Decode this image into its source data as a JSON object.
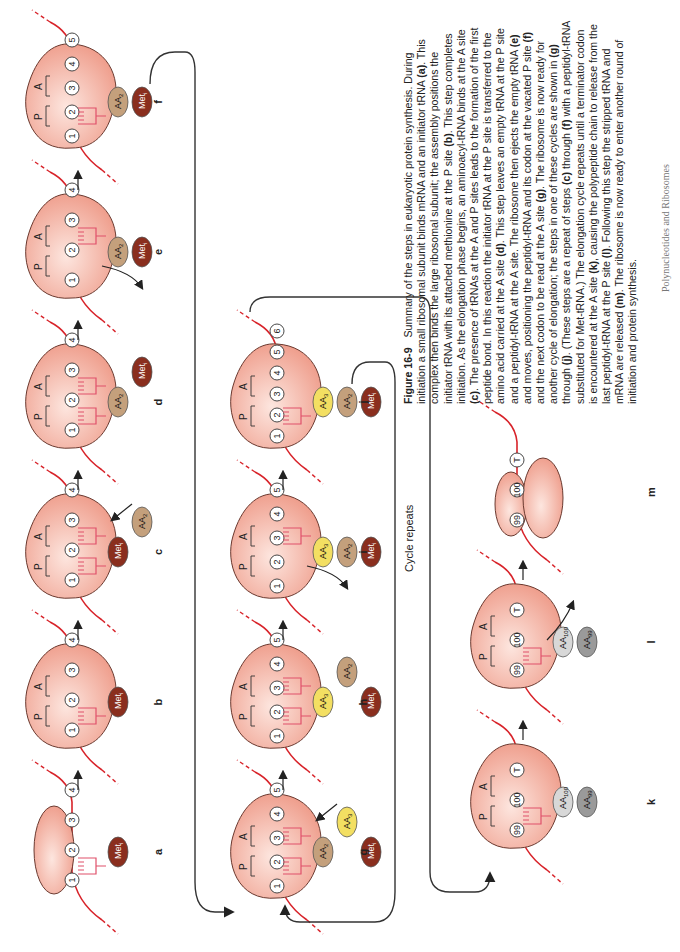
{
  "figure": {
    "number": "Figure 16-9",
    "caption_segments": [
      {
        "text": "Summary of the steps in eukaryotic protein synthesis. During initiation a small ribosomal subunit binds mRNA and an initiator tRNA "
      },
      {
        "text": "(a)",
        "bold": true
      },
      {
        "text": ". This complex then binds the large ribosomal subunit; the assembly positions the initiator tRNA with its attached methionine at the P site "
      },
      {
        "text": "(b)",
        "bold": true
      },
      {
        "text": ". This step completes initiation. As the elongation phase begins, an aminoacyl-tRNA binds at the A site "
      },
      {
        "text": "(c)",
        "bold": true
      },
      {
        "text": ". The presence of tRNAs at the A and P sites leads to the formation of the first peptide bond. In this reaction the initiator tRNA at the P site is transferred to the amino acid carried at the A site "
      },
      {
        "text": "(d)",
        "bold": true
      },
      {
        "text": ". This step leaves an empty tRNA at the P site and a peptidyl-tRNA at the A site. The ribosome then ejects the empty tRNA "
      },
      {
        "text": "(e)",
        "bold": true
      },
      {
        "text": " and moves, positioning the peptidyl-tRNA and its codon at the vacated P site "
      },
      {
        "text": "(f)",
        "bold": true
      },
      {
        "text": " and the next codon to be read at the A site "
      },
      {
        "text": "(g)",
        "bold": true
      },
      {
        "text": ". The ribosome is now ready for another cycle of elongation; the steps in one of these cycles are shown in "
      },
      {
        "text": "(g)",
        "bold": true
      },
      {
        "text": " through "
      },
      {
        "text": "(j)",
        "bold": true
      },
      {
        "text": ". (These steps are a repeat of steps "
      },
      {
        "text": "(c)",
        "bold": true
      },
      {
        "text": " through "
      },
      {
        "text": "(f)",
        "bold": true
      },
      {
        "text": " with a peptidyl-tRNA substituted for Met-tRNA.) The elongation cycle repeats until a terminator codon is encountered at the A site "
      },
      {
        "text": "(k)",
        "bold": true
      },
      {
        "text": ", causing the polypeptide chain to release from the last peptidyl-tRNA at the P site "
      },
      {
        "text": "(l)",
        "bold": true
      },
      {
        "text": ". Following this step the stripped tRNA and mRNA are released "
      },
      {
        "text": "(m)",
        "bold": true
      },
      {
        "text": ". The ribosome is now ready to enter another round of initiation and protein synthesis."
      }
    ]
  },
  "cycle_label": "Cycle repeats",
  "footer": "Polynucleotides and Ribosomes",
  "colors": {
    "ribosome": "#f0a596",
    "ribosome_light": "#fbe1da",
    "mrna": "#d8232a",
    "trna": "#e0506a",
    "met": "#8a2e1e",
    "aa2": "#c4a07c",
    "aa3": "#f3df62",
    "aa100": "#d8d8d8",
    "aa99": "#9a9a9a"
  },
  "site_labels": {
    "p": "P",
    "a": "A"
  },
  "panels": [
    {
      "id": "a",
      "label": "a",
      "x": 40,
      "y": 10,
      "subunit": "small",
      "codons": [
        "1",
        "2",
        "3",
        "4"
      ],
      "chain": [
        "Met_i"
      ],
      "trna_sites": [
        "P"
      ],
      "sites": false
    },
    {
      "id": "b",
      "label": "b",
      "x": 190,
      "y": 10,
      "subunit": "full",
      "codons": [
        "1",
        "2",
        "3",
        "4"
      ],
      "chain": [
        "Met_i"
      ],
      "trna_sites": [
        "P"
      ],
      "sites": true
    },
    {
      "id": "c",
      "label": "c",
      "x": 340,
      "y": 10,
      "subunit": "full",
      "codons": [
        "1",
        "2",
        "3",
        "4"
      ],
      "chain": [
        "Met_i",
        "AA_2"
      ],
      "trna_sites": [
        "P",
        "A"
      ],
      "sites": true,
      "incoming": true
    },
    {
      "id": "d",
      "label": "d",
      "x": 490,
      "y": 10,
      "subunit": "full",
      "codons": [
        "1",
        "2",
        "3",
        "4"
      ],
      "chain": [
        "AA_2",
        "Met_i"
      ],
      "trna_sites": [
        "P",
        "A"
      ],
      "sites": true,
      "transfer": true
    },
    {
      "id": "e",
      "label": "e",
      "x": 640,
      "y": 10,
      "subunit": "full",
      "codons": [
        "1",
        "2",
        "3",
        "4"
      ],
      "chain": [
        "AA_2",
        "Met_i"
      ],
      "trna_sites": [
        "A"
      ],
      "sites": true,
      "eject": true
    },
    {
      "id": "f",
      "label": "f",
      "x": 790,
      "y": 10,
      "subunit": "full",
      "codons": [
        "1",
        "2",
        "3",
        "4",
        "5"
      ],
      "chain": [
        "AA_2",
        "Met_i"
      ],
      "trna_sites": [
        "P"
      ],
      "sites": true,
      "shift": true
    },
    {
      "id": "g",
      "label": "g",
      "x": 40,
      "y": 215,
      "subunit": "full",
      "codons": [
        "1",
        "2",
        "3",
        "4",
        "5"
      ],
      "chain": [
        "AA_2",
        "AA_3",
        "Met_i"
      ],
      "trna_sites": [
        "P",
        "A"
      ],
      "sites": true,
      "incoming": true
    },
    {
      "id": "h",
      "label": "h",
      "x": 190,
      "y": 215,
      "subunit": "full",
      "codons": [
        "1",
        "2",
        "3",
        "4",
        "5"
      ],
      "chain": [
        "AA_3",
        "AA_2",
        "Met_i"
      ],
      "trna_sites": [
        "P",
        "A"
      ],
      "sites": true,
      "transfer": true
    },
    {
      "id": "i",
      "label": "i",
      "x": 340,
      "y": 215,
      "subunit": "full",
      "codons": [
        "1",
        "2",
        "3",
        "4",
        "5"
      ],
      "chain": [
        "AA_3",
        "AA_2",
        "Met_i"
      ],
      "trna_sites": [
        "A"
      ],
      "sites": true,
      "eject": true
    },
    {
      "id": "j",
      "label": "j",
      "x": 490,
      "y": 215,
      "subunit": "full",
      "codons": [
        "1",
        "2",
        "3",
        "4",
        "5",
        "6"
      ],
      "chain": [
        "AA_3",
        "AA_2",
        "Met_i"
      ],
      "trna_sites": [
        "P"
      ],
      "sites": true,
      "shift": true
    },
    {
      "id": "k",
      "label": "k",
      "x": 90,
      "y": 455,
      "subunit": "full",
      "codons": [
        "99",
        "100",
        "T"
      ],
      "chain": [
        "AA_100",
        "AA_99"
      ],
      "trna_sites": [
        "P"
      ],
      "sites": true
    },
    {
      "id": "l",
      "label": "l",
      "x": 250,
      "y": 455,
      "subunit": "full",
      "codons": [
        "99",
        "100",
        "T"
      ],
      "chain": [
        "AA_100",
        "AA_99"
      ],
      "trna_sites": [
        "P"
      ],
      "sites": true,
      "release": true
    },
    {
      "id": "m",
      "label": "m",
      "x": 400,
      "y": 455,
      "subunit": "split",
      "codons": [
        "99",
        "100",
        "T"
      ],
      "chain": [],
      "trna_sites": [],
      "sites": false
    }
  ]
}
